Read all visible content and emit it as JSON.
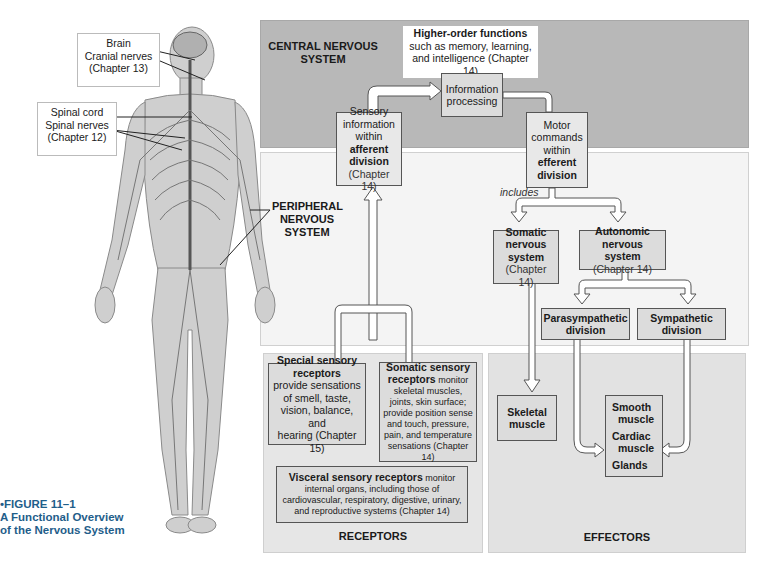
{
  "figure": {
    "bullet": "•",
    "number": "FIGURE 11–1",
    "title_line1": "A Functional Overview",
    "title_line2": "of the Nervous System",
    "caption_color": "#1f5e8a"
  },
  "body_labels": {
    "brain_box": {
      "line1": "Brain",
      "line2": "Cranial nerves",
      "line3": "(Chapter 13)"
    },
    "spinal_box": {
      "line1": "Spinal cord",
      "line2": "Spinal nerves",
      "line3": "(Chapter 12)"
    },
    "pns_label": {
      "line1": "PERIPHERAL",
      "line2": "NERVOUS",
      "line3": "SYSTEM"
    }
  },
  "panels": {
    "cns": {
      "line1": "CENTRAL NERVOUS",
      "line2": "SYSTEM",
      "color": "#b8b8b8"
    },
    "receptors": {
      "title": "RECEPTORS",
      "color": "#e6e6e6"
    },
    "effectors": {
      "title": "EFFECTORS",
      "color": "#e2e2e2"
    },
    "pns_color": "#f4f4f4"
  },
  "higher_order": {
    "bold": "Higher-order functions",
    "line2": "such as memory, learning,",
    "line3": "and intelligence (Chapter 14)"
  },
  "nodes": {
    "info_processing": {
      "line1": "Information",
      "line2": "processing"
    },
    "sensory_info": {
      "line1": "Sensory",
      "line2": "information",
      "line3": "within",
      "bold1": "afferent",
      "bold2": "division",
      "chapter": "(Chapter 14)"
    },
    "motor_commands": {
      "line1": "Motor",
      "line2": "commands",
      "line3": "within",
      "bold1": "efferent",
      "bold2": "division"
    },
    "includes": "includes",
    "somatic_ns": {
      "bold1": "Somatic",
      "bold2": "nervous",
      "bold3": "system",
      "chapter": "(Chapter 14)"
    },
    "autonomic_ns": {
      "bold1": "Autonomic",
      "bold2": "nervous system",
      "chapter": "(Chapter 14)"
    },
    "parasympathetic": {
      "bold1": "Parasympathetic",
      "bold2": "division"
    },
    "sympathetic": {
      "bold1": "Sympathetic",
      "bold2": "division"
    },
    "skeletal_muscle": {
      "bold1": "Skeletal",
      "bold2": "muscle"
    },
    "smooth_cardiac_glands": {
      "item1a": "Smooth",
      "item1b": "muscle",
      "item2a": "Cardiac",
      "item2b": "muscle",
      "item3": "Glands"
    },
    "special_sensory": {
      "bold1": "Special sensory",
      "bold2": "receptors",
      "line1": "provide sensations",
      "line2": "of smell, taste,",
      "line3": "vision, balance, and",
      "line4": "hearing (Chapter 15)"
    },
    "somatic_sensory": {
      "bold1": "Somatic sensory",
      "bold2": "receptors",
      "inline": "monitor",
      "line1": "skeletal muscles,",
      "line2": "joints, skin surface;",
      "line3": "provide position sense",
      "line4": "and touch, pressure,",
      "line5": "pain, and temperature",
      "line6": "sensations (Chapter 14)"
    },
    "visceral_sensory": {
      "bold": "Visceral sensory receptors",
      "inline": "monitor",
      "line1": "internal organs, including those of",
      "line2": "cardiovascular, respiratory, digestive, urinary,",
      "line3": "and reproductive systems (Chapter 14)"
    }
  }
}
